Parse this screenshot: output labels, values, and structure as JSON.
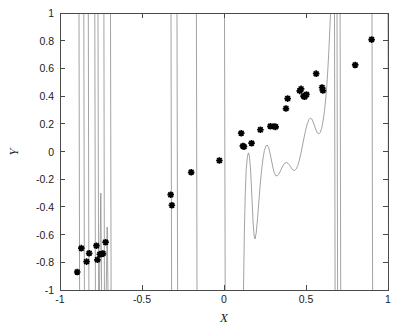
{
  "figure": {
    "background_color": "#ffffff",
    "width": 407,
    "height": 332
  },
  "chart_data": {
    "type": "scatter",
    "title": "",
    "subtitle": "",
    "xlabel": "X",
    "ylabel": "Y",
    "xlim": [
      -1,
      1
    ],
    "ylim": [
      -1,
      1
    ],
    "grid": false,
    "legend": null,
    "legend_position": "none",
    "xticks": [
      -1,
      -0.5,
      0,
      0.5,
      1
    ],
    "xticklabels": [
      "-1",
      "-0.5",
      "0",
      "0.5",
      "1"
    ],
    "yticks": [
      -1,
      -0.8,
      -0.6,
      -0.4,
      -0.2,
      0,
      0.2,
      0.4,
      0.6,
      0.8,
      1
    ],
    "yticklabels": [
      "-1",
      "-0.8",
      "-0.6",
      "-0.4",
      "-0.2",
      "0",
      "0.2",
      "0.4",
      "0.6",
      "0.8",
      "1"
    ],
    "marker_style": "star-asterisk",
    "marker_color": "#000000",
    "curve_color": "#8c8c8c",
    "series": [
      {
        "name": "data-points",
        "kind": "scatter",
        "points": [
          [
            -0.895,
            -0.87
          ],
          [
            -0.87,
            -0.698
          ],
          [
            -0.838,
            -0.795
          ],
          [
            -0.822,
            -0.735
          ],
          [
            -0.778,
            -0.68
          ],
          [
            -0.772,
            -0.782
          ],
          [
            -0.757,
            -0.742
          ],
          [
            -0.745,
            -0.74
          ],
          [
            -0.738,
            -0.737
          ],
          [
            -0.722,
            -0.655
          ],
          [
            -0.325,
            -0.312
          ],
          [
            -0.318,
            -0.388
          ],
          [
            -0.2,
            -0.15
          ],
          [
            -0.028,
            -0.065
          ],
          [
            0.105,
            0.132
          ],
          [
            0.115,
            0.04
          ],
          [
            0.122,
            0.035
          ],
          [
            0.168,
            0.06
          ],
          [
            0.222,
            0.157
          ],
          [
            0.283,
            0.182
          ],
          [
            0.305,
            0.18
          ],
          [
            0.315,
            0.178
          ],
          [
            0.378,
            0.31
          ],
          [
            0.388,
            0.382
          ],
          [
            0.462,
            0.438
          ],
          [
            0.47,
            0.452
          ],
          [
            0.485,
            0.4
          ],
          [
            0.492,
            0.395
          ],
          [
            0.503,
            0.412
          ],
          [
            0.562,
            0.562
          ],
          [
            0.598,
            0.462
          ],
          [
            0.603,
            0.44
          ],
          [
            0.8,
            0.625
          ],
          [
            0.9,
            0.808
          ]
        ]
      },
      {
        "name": "interpolating-fit-curve",
        "kind": "line",
        "description": "High-order interpolating fit with large oscillations; several near-vertical excursions exceed the plotted y-range and are clipped at y = -1 and y = 1"
      }
    ],
    "annotations": []
  }
}
